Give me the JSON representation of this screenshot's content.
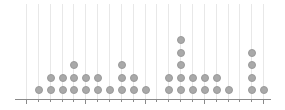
{
  "chart_data": {
    "type": "dot",
    "title": "",
    "xlabel": "",
    "ylabel": "",
    "x": [
      0,
      1,
      2,
      3,
      4,
      5,
      6,
      7,
      8,
      9,
      10,
      11,
      12,
      13,
      14,
      15,
      16,
      17,
      18,
      19,
      20
    ],
    "values": [
      0,
      1,
      2,
      2,
      3,
      2,
      2,
      1,
      3,
      2,
      1,
      0,
      2,
      5,
      2,
      2,
      2,
      1,
      0,
      4,
      1
    ],
    "grid": true,
    "tick_labels_visible": false
  },
  "layout": {
    "x0": 26,
    "dx": 11.86,
    "baseline_y": 90,
    "dy": 12.4,
    "dot_size": 8
  },
  "colors": {
    "dot": "#a9a9a9",
    "grid": "#e8e8e8",
    "axis": "#8a8a8a"
  }
}
